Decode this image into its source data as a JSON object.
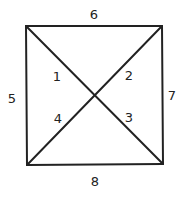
{
  "diagram": {
    "shape": "square-with-diagonals",
    "stroke_color": "#222222",
    "edges": [
      {
        "label": "6",
        "side": "top"
      },
      {
        "label": "7",
        "side": "right"
      },
      {
        "label": "8",
        "side": "bottom"
      },
      {
        "label": "5",
        "side": "left"
      }
    ],
    "regions": [
      {
        "label": "1",
        "position": "left-upper"
      },
      {
        "label": "2",
        "position": "right-upper"
      },
      {
        "label": "3",
        "position": "right-lower"
      },
      {
        "label": "4",
        "position": "left-lower"
      }
    ]
  }
}
